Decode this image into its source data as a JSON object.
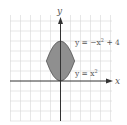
{
  "diagram": {
    "axes": {
      "x_label": "x",
      "y_label": "y"
    },
    "curves": [
      {
        "label": "y = −x² + 4",
        "sup": "2"
      },
      {
        "label": "y = x²"
      }
    ],
    "curve_labels": {
      "upper_prefix": "y = −x",
      "upper_exp": "2",
      "upper_suffix": " + 4",
      "lower_prefix": "y = x",
      "lower_exp": "2"
    },
    "grid": {
      "x_min": -5,
      "x_max": 5,
      "y_min": -4,
      "y_max": 6,
      "unit": 1
    },
    "region": {
      "description": "Shaded region bounded by y = -x^2 + 4 and y = x^2",
      "intersections": [
        [
          -1.414,
          2
        ],
        [
          1.414,
          2
        ]
      ]
    },
    "colors": {
      "fill": "#8f8f8f",
      "curve": "#555555",
      "grid": "#d4d4d4",
      "axis": "#333333"
    }
  }
}
